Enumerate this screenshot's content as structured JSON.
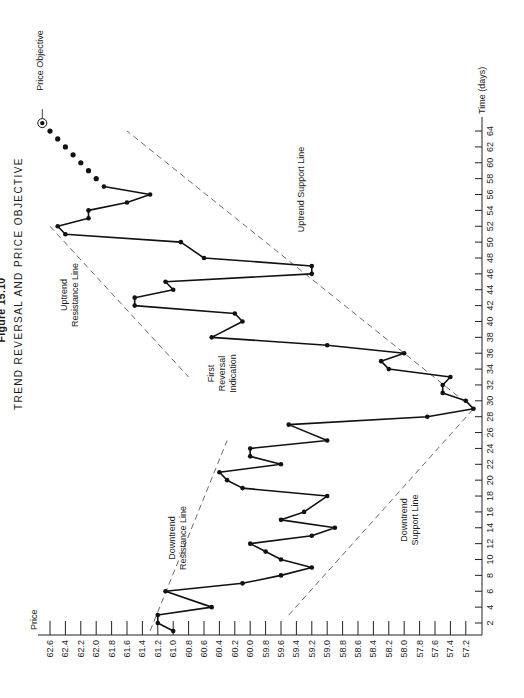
{
  "figure": {
    "number": "Figure 15.10",
    "title": "TREND REVERSAL AND PRICE OBJECTIVE"
  },
  "annotations": {
    "price_objective": "Price Objective",
    "uptrend_support": "Uptrend Support Line",
    "uptrend_resistance": [
      "Uptrend",
      "Resistance Line"
    ],
    "first_reversal": [
      "First",
      "Reversal",
      "Indication"
    ],
    "downtrend_resistance": [
      "Downtrend",
      "Resistance Line"
    ],
    "downtrend_support": [
      "Downtrend",
      "Support Line"
    ]
  },
  "chart_data": {
    "type": "line",
    "title": "TREND REVERSAL AND PRICE OBJECTIVE",
    "subtitle": "Figure 15.10",
    "xlabel": "Time (days)",
    "ylabel": "Price",
    "orientation": "rotated 90 degrees counter-clockwise (price axis along bottom, time axis along right edge)",
    "xlim": [
      0,
      65
    ],
    "ylim": [
      57.2,
      62.6
    ],
    "grid": false,
    "x_ticks": [
      2,
      4,
      6,
      8,
      10,
      12,
      14,
      16,
      18,
      20,
      22,
      24,
      26,
      28,
      30,
      32,
      34,
      36,
      38,
      40,
      42,
      44,
      46,
      48,
      50,
      52,
      54,
      56,
      58,
      60,
      62,
      64
    ],
    "y_ticks": [
      "62.6",
      "62.4",
      "62.2",
      "62.0",
      "61.8",
      "61.6",
      "61.4",
      "61.2",
      "61.0",
      "60.8",
      "60.6",
      "60.4",
      "60.2",
      "60.0",
      "59.8",
      "59.6",
      "59.4",
      "59.2",
      "59.0",
      "58.8",
      "58.6",
      "58.4",
      "58.2",
      "58.0",
      "57.8",
      "57.6",
      "57.4",
      "57.2"
    ],
    "series": [
      {
        "name": "Price",
        "style": "solid line with dot markers",
        "points": [
          [
            1,
            61.0
          ],
          [
            2,
            61.2
          ],
          [
            3,
            61.2
          ],
          [
            4,
            60.5
          ],
          [
            6,
            61.1
          ],
          [
            7,
            60.1
          ],
          [
            8,
            59.6
          ],
          [
            9,
            59.2
          ],
          [
            10,
            59.6
          ],
          [
            11,
            59.8
          ],
          [
            12,
            60.0
          ],
          [
            13,
            59.2
          ],
          [
            14,
            58.9
          ],
          [
            15,
            59.6
          ],
          [
            16,
            59.3
          ],
          [
            18,
            59.0
          ],
          [
            19,
            60.1
          ],
          [
            20,
            60.3
          ],
          [
            21,
            60.4
          ],
          [
            22,
            59.6
          ],
          [
            23,
            60.0
          ],
          [
            24,
            60.0
          ],
          [
            25,
            59.0
          ],
          [
            27,
            59.5
          ],
          [
            28,
            57.7
          ],
          [
            29,
            57.1
          ],
          [
            30,
            57.2
          ],
          [
            31,
            57.5
          ],
          [
            32,
            57.5
          ],
          [
            33,
            57.4
          ],
          [
            34,
            58.2
          ],
          [
            35,
            58.3
          ],
          [
            36,
            58.0
          ],
          [
            37,
            59.0
          ],
          [
            38,
            60.5
          ],
          [
            40,
            60.1
          ],
          [
            41,
            60.2
          ],
          [
            42,
            61.5
          ],
          [
            43,
            61.5
          ],
          [
            44,
            61.0
          ],
          [
            45,
            61.1
          ],
          [
            46,
            59.2
          ],
          [
            47,
            59.2
          ],
          [
            48,
            60.6
          ],
          [
            50,
            60.9
          ],
          [
            51,
            62.4
          ],
          [
            52,
            62.5
          ],
          [
            53,
            62.1
          ],
          [
            54,
            62.1
          ],
          [
            55,
            61.6
          ],
          [
            56,
            61.3
          ],
          [
            57,
            61.9
          ]
        ]
      },
      {
        "name": "Projected path",
        "style": "dots only",
        "points": [
          [
            58,
            62.0
          ],
          [
            59,
            62.1
          ],
          [
            60,
            62.2
          ],
          [
            61,
            62.3
          ],
          [
            62,
            62.4
          ],
          [
            63,
            62.5
          ],
          [
            64,
            62.6
          ]
        ]
      },
      {
        "name": "Price Objective",
        "style": "circled dot",
        "points": [
          [
            65,
            62.7
          ]
        ]
      }
    ],
    "trendlines": [
      {
        "name": "Downtrend Resistance Line",
        "style": "dashed",
        "from": [
          1,
          61.3
        ],
        "to": [
          25,
          60.3
        ]
      },
      {
        "name": "Downtrend Support Line",
        "style": "dashed",
        "from": [
          3,
          59.5
        ],
        "to": [
          29,
          57.1
        ]
      },
      {
        "name": "Uptrend Resistance Line",
        "style": "dashed",
        "from": [
          52,
          62.6
        ],
        "to": [
          33,
          60.8
        ]
      },
      {
        "name": "Uptrend Support Line",
        "style": "dashed",
        "from": [
          29,
          57.1
        ],
        "to": [
          64,
          61.6
        ]
      }
    ]
  }
}
